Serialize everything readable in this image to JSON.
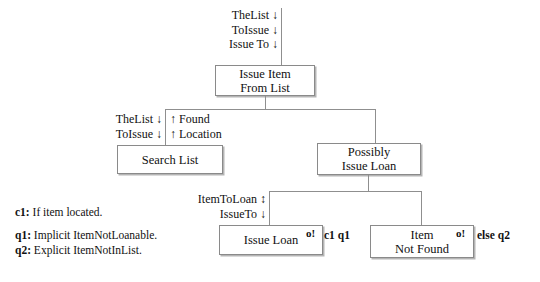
{
  "diagram": {
    "boxes": [
      {
        "id": "issue-item-from-list",
        "lines": [
          "Issue Item",
          "From List"
        ]
      },
      {
        "id": "search-list",
        "lines": [
          "Search List"
        ]
      },
      {
        "id": "possibly-issue-loan",
        "lines": [
          "Possibly",
          "Issue Loan"
        ]
      },
      {
        "id": "issue-loan",
        "lines": [
          "Issue Loan"
        ],
        "marker": "o!"
      },
      {
        "id": "item-not-found",
        "lines": [
          "Item",
          "Not Found"
        ],
        "marker": "o!"
      }
    ],
    "top_inputs": [
      "TheList ↓",
      "ToIssue ↓",
      "Issue To ↓"
    ],
    "search_inputs": [
      "TheList ↓",
      "ToIssue ↓"
    ],
    "search_outputs": [
      "↑ Found",
      "↑ Location"
    ],
    "loan_inputs": [
      "ItemToLoan ↕",
      "IssueTo ↓"
    ],
    "annotations": [
      {
        "id": "issue-loan-guard",
        "text": "c1 q1"
      },
      {
        "id": "item-not-found-guard",
        "text": "else q2"
      }
    ],
    "legend": [
      {
        "key": "c1:",
        "text": "If item located."
      },
      {
        "key": "q1:",
        "text": "Implicit ItemNotLoanable."
      },
      {
        "key": "q2:",
        "text": "Explicit ItemNotInList."
      }
    ]
  },
  "colors": {
    "box_border": "#8a8a8a",
    "box_shadow": "#b5b5b5",
    "line": "#8f8f8f",
    "text": "#111111",
    "background": "#ffffff"
  }
}
